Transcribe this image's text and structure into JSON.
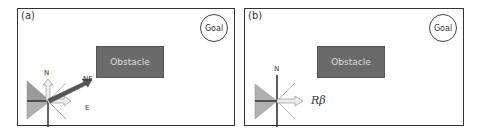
{
  "panels": [
    {
      "label": "(a)",
      "goal": "Goal",
      "obstacle": "Obstacle",
      "compass_labels": {
        "north": "N",
        "northeast": "NE",
        "east": "E"
      }
    },
    {
      "label": "(b)",
      "goal": "Goal",
      "obstacle": "Obstacle",
      "compass_labels": {
        "north": "N",
        "heading": "Rβ"
      }
    }
  ],
  "colors": {
    "obstacle_fill": "#6a6a6a",
    "obstacle_text": "#dddddd",
    "cone_fill": "#b0b0b0",
    "arrow_dark": "#555555",
    "arrow_light": "#e8e8e8",
    "border": "#333333"
  }
}
